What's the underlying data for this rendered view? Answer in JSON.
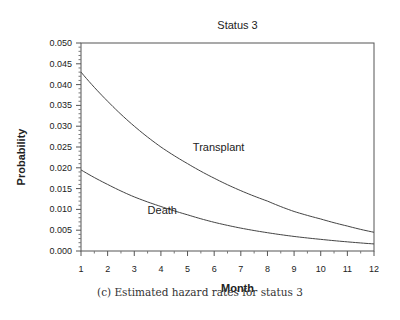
{
  "chart_data": {
    "type": "line",
    "title": "Status 3",
    "xlabel": "Month",
    "ylabel": "Probability",
    "x": [
      1,
      2,
      3,
      4,
      5,
      6,
      7,
      8,
      9,
      10,
      11,
      12
    ],
    "xlim": [
      1,
      12
    ],
    "ylim": [
      0,
      0.05
    ],
    "xticks": [
      "1",
      "2",
      "3",
      "4",
      "5",
      "6",
      "7",
      "8",
      "9",
      "10",
      "11",
      "12"
    ],
    "yticks": [
      "0.000",
      "0.005",
      "0.010",
      "0.015",
      "0.020",
      "0.025",
      "0.030",
      "0.035",
      "0.040",
      "0.045",
      "0.050"
    ],
    "grid": false,
    "series": [
      {
        "name": "Transplant",
        "values": [
          0.043,
          0.036,
          0.03,
          0.025,
          0.021,
          0.0175,
          0.0145,
          0.012,
          0.0095,
          0.0077,
          0.006,
          0.0045
        ]
      },
      {
        "name": "Death",
        "values": [
          0.0195,
          0.016,
          0.013,
          0.0107,
          0.0087,
          0.0069,
          0.0055,
          0.0044,
          0.0035,
          0.0028,
          0.0022,
          0.0017
        ]
      }
    ],
    "annotations": [
      {
        "text": "Transplant",
        "x": 5.2,
        "y": 0.024
      },
      {
        "text": "Death",
        "x": 3.5,
        "y": 0.009
      }
    ],
    "caption": "(c) Estimated hazard rates for status 3"
  }
}
